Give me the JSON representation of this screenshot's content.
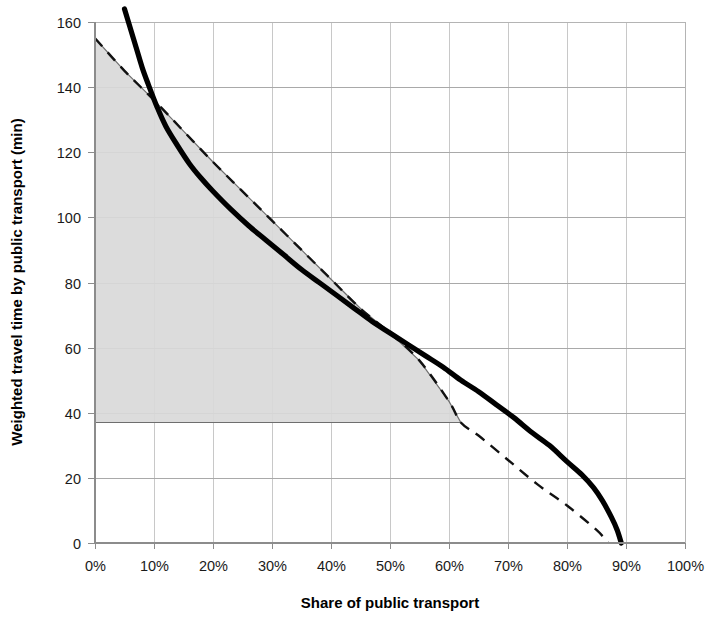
{
  "chart_data": {
    "type": "line",
    "title": "",
    "xlabel": "Share of public transport",
    "ylabel": "Weighted travel time by public transport (min)",
    "xlim": [
      0,
      100
    ],
    "ylim": [
      0,
      160
    ],
    "grid": true,
    "legend_position": "none",
    "x_tick_labels": [
      "0%",
      "10%",
      "20%",
      "30%",
      "40%",
      "50%",
      "60%",
      "70%",
      "80%",
      "90%",
      "100%"
    ],
    "x_tick_values": [
      0,
      10,
      20,
      30,
      40,
      50,
      60,
      70,
      80,
      90,
      100
    ],
    "y_tick_labels": [
      "0",
      "20",
      "40",
      "60",
      "80",
      "100",
      "120",
      "140",
      "160"
    ],
    "y_tick_values": [
      0,
      20,
      40,
      60,
      80,
      100,
      120,
      140,
      160
    ],
    "series": [
      {
        "name": "solid-thick-curve",
        "style": "solid",
        "color": "#000000",
        "x": [
          5.0,
          6.0,
          7.0,
          8.0,
          9.0,
          10.5,
          12.0,
          14.0,
          16.0,
          18.0,
          20.0,
          23.0,
          26.0,
          29.0,
          32.0,
          35.0,
          38.0,
          41.0,
          44.0,
          47.0,
          50.0,
          53.0,
          56.0,
          59.0,
          62.0,
          65.0,
          68.0,
          71.0,
          74.0,
          77.0,
          80.0,
          82.5,
          84.5,
          86.0,
          87.5,
          88.5,
          89.2
        ],
        "y": [
          164.0,
          158.0,
          152.0,
          146.0,
          141.0,
          134.0,
          128.0,
          122.0,
          116.5,
          112.0,
          108.0,
          102.5,
          97.5,
          93.0,
          88.5,
          84.0,
          80.0,
          76.0,
          72.0,
          68.0,
          64.5,
          61.0,
          57.5,
          54.0,
          50.0,
          46.5,
          42.5,
          38.5,
          34.0,
          30.0,
          25.0,
          21.0,
          17.0,
          13.0,
          8.0,
          4.0,
          0.0
        ]
      },
      {
        "name": "dashed-reference-line",
        "style": "dashed",
        "color": "#111111",
        "x": [
          0.0,
          5.0,
          10.0,
          15.0,
          20.0,
          25.0,
          30.0,
          35.0,
          40.0,
          45.0,
          50.0,
          55.0,
          60.0,
          62.0,
          65.0,
          70.0,
          75.0,
          80.0,
          85.0,
          87.0
        ],
        "y": [
          155.0,
          145.0,
          136.0,
          126.5,
          117.0,
          108.0,
          99.0,
          90.0,
          81.0,
          72.0,
          64.5,
          56.0,
          43.5,
          37.0,
          33.0,
          25.5,
          18.0,
          11.5,
          4.0,
          0.0
        ]
      }
    ],
    "shaded_region": {
      "name": "consumer-surplus-area",
      "fill_color": "#d9d9d9",
      "edge_color": "#6e6e6e",
      "baseline_y": 37.0,
      "x_start": 0.0,
      "x_end": 62.0,
      "description": "Area under the dashed reference line above the 37 min baseline, from 0% to about 62%"
    },
    "annotations": [],
    "crossings": [
      {
        "x": 10.0,
        "y": 133.0
      },
      {
        "x": 51.0,
        "y": 63.5
      }
    ]
  }
}
